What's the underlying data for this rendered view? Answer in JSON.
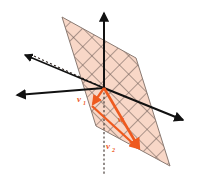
{
  "figure": {
    "background_color": "#ffffff",
    "width": 198,
    "height": 183
  },
  "colors": {
    "plane_fill": "#f8d7c7",
    "plane_mesh": "#6b5b55",
    "plane_edge": "#8a7a72",
    "axis": "#111111",
    "vector": "#ee5a1f",
    "vector_dark": "#e8531a",
    "dotted": "#3a2f2b",
    "label": "#ee5a1f"
  },
  "plane": {
    "name": "shaded-grid-plane",
    "corners": [
      [
        62,
        17
      ],
      [
        136,
        58
      ],
      [
        170,
        166
      ],
      [
        96,
        126
      ]
    ],
    "mesh_spacing": 13,
    "mesh_angle_deg": 45,
    "opacity": 0.95
  },
  "axes": [
    {
      "name": "axis-vertical-up",
      "from": [
        104,
        88
      ],
      "to": [
        104,
        11
      ],
      "arrow": true,
      "style": "solid"
    },
    {
      "name": "axis-right",
      "from": [
        104,
        88
      ],
      "to": [
        186,
        121
      ],
      "arrow": true,
      "style": "solid"
    },
    {
      "name": "axis-left",
      "from": [
        104,
        88
      ],
      "to": [
        14,
        96
      ],
      "arrow": true,
      "style": "solid"
    },
    {
      "name": "axis-depth-back",
      "from": [
        104,
        88
      ],
      "to": [
        22,
        54
      ],
      "arrow": true,
      "style": "solid"
    }
  ],
  "dotted_lines": [
    {
      "name": "dotted-in-plane-diagonal",
      "from": [
        104,
        88
      ],
      "to": [
        34,
        56
      ]
    },
    {
      "name": "dotted-vertical-down",
      "from": [
        104,
        88
      ],
      "to": [
        104,
        176
      ]
    }
  ],
  "vectors": [
    {
      "name": "vector-v1",
      "label": "v",
      "subscript": "1",
      "from": [
        104,
        88
      ],
      "to": [
        92,
        106
      ],
      "label_pos": [
        79,
        100
      ]
    },
    {
      "name": "vector-w",
      "label": "w",
      "subscript": "",
      "from": [
        104,
        88
      ],
      "to": [
        141,
        151
      ],
      "label_pos": [
        122,
        119
      ]
    },
    {
      "name": "vector-v2",
      "label": "v",
      "subscript": "2",
      "from": [
        92,
        106
      ],
      "to": [
        141,
        151
      ],
      "label_pos": [
        110,
        146
      ]
    }
  ],
  "labels": {
    "v1": "v",
    "v1_sub": "1",
    "w": "w",
    "w_sub": "",
    "v2": "v",
    "v2_sub": "2"
  }
}
